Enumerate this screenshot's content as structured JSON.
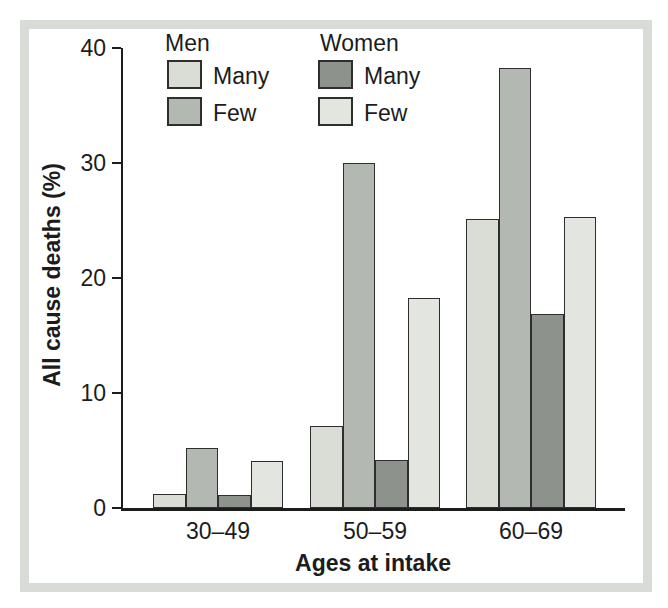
{
  "figure": {
    "background_color": "#ffffff",
    "frame_color": "#d9dbd7",
    "axis_color": "#1c1c1c",
    "bar_border_color": "#2e2e2e"
  },
  "legend": {
    "men_title": "Men",
    "women_title": "Women"
  },
  "chart_data": {
    "type": "bar",
    "title": "",
    "xlabel": "Ages at intake",
    "ylabel": "All cause deaths (%)",
    "categories": [
      "30–49",
      "50–59",
      "60–69"
    ],
    "y_ticks": [
      0,
      10,
      20,
      30,
      40
    ],
    "ylim": [
      0,
      40
    ],
    "grid": false,
    "legend_position": "top-left",
    "series": [
      {
        "group": "Men",
        "label": "Many",
        "color": "#d9ddd6",
        "values": [
          1.2,
          7.1,
          25.1
        ]
      },
      {
        "group": "Men",
        "label": "Few",
        "color": "#b4b8b2",
        "values": [
          5.2,
          30.0,
          38.3
        ]
      },
      {
        "group": "Women",
        "label": "Many",
        "color": "#8d928c",
        "values": [
          1.1,
          4.2,
          16.9
        ]
      },
      {
        "group": "Women",
        "label": "Few",
        "color": "#e3e6e0",
        "values": [
          4.1,
          18.3,
          25.3
        ]
      }
    ]
  }
}
